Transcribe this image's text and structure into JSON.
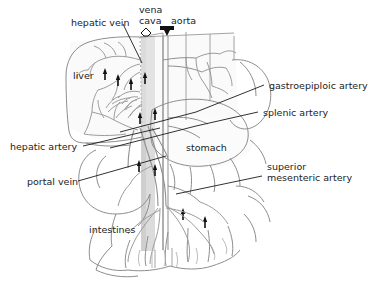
{
  "figure": {
    "type": "anatomical-diagram",
    "background_color": "#ffffff",
    "ink_color": "#222222",
    "organ_outline_color": "#8a8a8a",
    "vessel_color": "#9a9a9a",
    "shading_color": "#d8d8d8"
  },
  "labels": {
    "hepatic_vein": "hepatic vein",
    "vena_cava": "vena\ncava",
    "vena_cava_line1": "vena",
    "vena_cava_line2": "cava",
    "aorta": "aorta",
    "liver": "liver",
    "gastroepiploic_artery": "gastroepiploic artery",
    "splenic_artery": "splenic artery",
    "hepatic_artery": "hepatic artery",
    "stomach": "stomach",
    "portal_vein": "portal vein",
    "superior_mesenteric_artery_line1": "superior",
    "superior_mesenteric_artery_line2": "mesenteric artery",
    "intestines": "intestines"
  },
  "markers": {
    "vena_cava_symbol": "hollow-pentagon-marker",
    "aorta_symbol": "filled-down-arrowhead",
    "flow_arrows": "small-black-flow-arrows"
  }
}
